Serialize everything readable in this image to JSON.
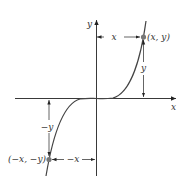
{
  "diagram": {
    "axes": {
      "x_label": "x",
      "y_label": "y"
    },
    "points": {
      "p1": {
        "label": "(x, y)"
      },
      "p2": {
        "label": "(−x, −y)"
      }
    },
    "dimensions": {
      "top_horizontal": "x",
      "right_vertical": "y",
      "left_vertical": "−y",
      "bottom_horizontal": "−x"
    },
    "colors": {
      "axis": "#222222",
      "curve": "#444444",
      "point": "#777777",
      "text": "#333333"
    }
  }
}
